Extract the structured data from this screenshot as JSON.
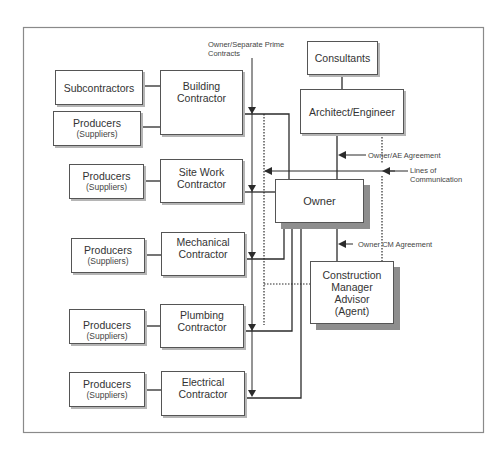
{
  "diagram": {
    "title_note": "Owner/Separate Prime Contracts",
    "title_note_lines": [
      "Owner/Separate Prime",
      "Contracts"
    ],
    "nodes": {
      "consultants": {
        "label": "Consultants"
      },
      "architect": {
        "label": "Architect/Engineer"
      },
      "owner": {
        "label": "Owner"
      },
      "cm": {
        "lines": [
          "Construction",
          "Manager",
          "Advisor",
          "(Agent)"
        ]
      },
      "building": {
        "lines": [
          "Building",
          "Contractor"
        ]
      },
      "sitework": {
        "lines": [
          "Site Work",
          "Contractor"
        ]
      },
      "mechanical": {
        "lines": [
          "Mechanical",
          "Contractor"
        ]
      },
      "plumbing": {
        "lines": [
          "Plumbing",
          "Contractor"
        ]
      },
      "electrical": {
        "lines": [
          "Electrical",
          "Contractor"
        ]
      },
      "subcontractors": {
        "label": "Subcontractors"
      },
      "producers": {
        "label": "Producers",
        "sub": "(Suppliers)"
      }
    },
    "annotations": {
      "owner_ae": "Owner/AE Agreement",
      "lines_comm": [
        "Lines of",
        "Communication"
      ],
      "owner_cm": "Owner CM Agreement"
    },
    "colors": {
      "line": "#2b2b2b",
      "frame": "#8a8a8a",
      "shadow_light": "#b5b5b5",
      "shadow_dark": "#8e8e8e"
    }
  }
}
